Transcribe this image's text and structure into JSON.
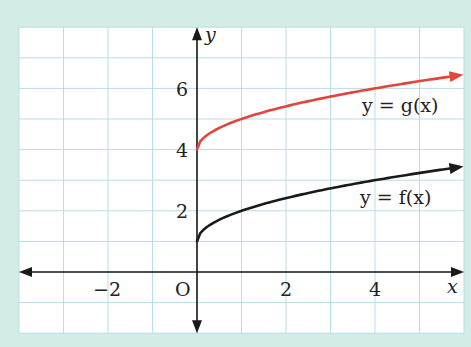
{
  "chart_data": {
    "type": "line",
    "title": "",
    "xlabel": "x",
    "ylabel": "y",
    "origin_label": "O",
    "xlim": [
      -4,
      6
    ],
    "ylim": [
      -2,
      8
    ],
    "grid": true,
    "x_ticks": [
      -2,
      2,
      4
    ],
    "y_ticks": [
      2,
      4,
      6
    ],
    "x_tick_labels": [
      "−2",
      "2",
      "4"
    ],
    "y_tick_labels": [
      "2",
      "4",
      "6"
    ],
    "series": [
      {
        "name": "y = f(x)",
        "color": "#1a1a1a",
        "x": [
          0,
          0.25,
          0.5,
          1,
          1.5,
          2,
          2.5,
          3,
          3.5,
          4,
          4.5,
          5,
          5.5,
          5.9
        ],
        "values": [
          1.0,
          1.5,
          1.71,
          2.0,
          2.22,
          2.41,
          2.58,
          2.73,
          2.87,
          3.0,
          3.12,
          3.24,
          3.35,
          3.43
        ]
      },
      {
        "name": "y = g(x)",
        "color": "#e0463b",
        "x": [
          0,
          0.25,
          0.5,
          1,
          1.5,
          2,
          2.5,
          3,
          3.5,
          4,
          4.5,
          5,
          5.5,
          5.9
        ],
        "values": [
          4.0,
          4.5,
          4.71,
          5.0,
          5.22,
          5.41,
          5.58,
          5.73,
          5.87,
          6.0,
          6.12,
          6.24,
          6.35,
          6.43
        ]
      }
    ],
    "annotations": [
      {
        "text": "y = g(x)",
        "x": 4.7,
        "y": 5.1
      },
      {
        "text": "y = f(x)",
        "x": 4.7,
        "y": 2.3
      }
    ]
  },
  "labels": {
    "x_axis": "x",
    "y_axis": "y",
    "origin": "O",
    "xt_m2": "−2",
    "xt_2": "2",
    "xt_4": "4",
    "yt_2": "2",
    "yt_4": "4",
    "yt_6": "6",
    "g_label_y": "y",
    "g_label_eq": " = ",
    "g_label_fn": "g(x)",
    "f_label_y": "y",
    "f_label_eq": " = ",
    "f_label_fn": "f(x)"
  }
}
